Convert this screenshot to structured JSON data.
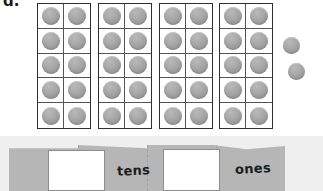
{
  "worksheet": {
    "problem_label": "d.",
    "background_color": "#ffffff",
    "mat_background_color": "#efefef"
  },
  "ten_frames": {
    "count": 4,
    "rows": 5,
    "columns": 2,
    "capacity_each": 10,
    "filled_each": 10,
    "counter_color": "#a0a0a0",
    "border_color": "#2f2f2f",
    "frames": [
      {
        "index": 1,
        "filled": 10
      },
      {
        "index": 2,
        "filled": 10
      },
      {
        "index": 3,
        "filled": 10
      },
      {
        "index": 4,
        "filled": 10
      }
    ]
  },
  "loose_counters": {
    "count": 2,
    "items": [
      {
        "index": 1,
        "x": 283,
        "y": 37
      },
      {
        "index": 2,
        "x": 288,
        "y": 63
      }
    ]
  },
  "totals": {
    "tens": 4,
    "ones": 2,
    "total": 42
  },
  "place_value_mat": {
    "banner_color": "#b6b6b6",
    "labels": {
      "tens": "tens",
      "ones": "ones"
    },
    "answer_boxes": [
      {
        "name": "tens-answer-box",
        "value": "",
        "placeholder": ""
      },
      {
        "name": "ones-answer-box",
        "value": "",
        "placeholder": ""
      }
    ]
  }
}
